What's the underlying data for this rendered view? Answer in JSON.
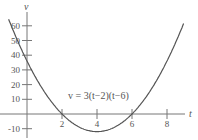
{
  "chart_data": {
    "type": "line",
    "title": "",
    "xlabel": "t",
    "ylabel": "v",
    "equation_label": "v = 3(t−2)(t−6)",
    "function": "v = 3(t-2)(t-6)",
    "x_ticks": [
      2,
      4,
      6,
      8
    ],
    "x_tick_labels": [
      "2",
      "4",
      "6",
      "8"
    ],
    "y_ticks": [
      -10,
      10,
      20,
      30,
      40,
      50,
      60
    ],
    "y_tick_labels": [
      "-10",
      "10",
      "20",
      "30",
      "40",
      "50",
      "60"
    ],
    "xlim": [
      -1.5,
      9.5
    ],
    "ylim": [
      -14,
      68
    ],
    "grid": false,
    "legend": null,
    "series": [
      {
        "name": "v = 3(t-2)(t-6)",
        "x": [
          -1,
          0,
          1,
          2,
          3,
          4,
          5,
          6,
          7,
          8,
          8.9
        ],
        "y": [
          63,
          36,
          15,
          0,
          -9,
          -12,
          -9,
          0,
          15,
          36,
          60
        ]
      }
    ],
    "annotations": [
      {
        "text": "v = 3(t−2)(t−6)",
        "x": 4,
        "y": 11
      }
    ],
    "colors": {
      "curve": "#555555",
      "axis": "#777777",
      "text": "#555555"
    }
  }
}
